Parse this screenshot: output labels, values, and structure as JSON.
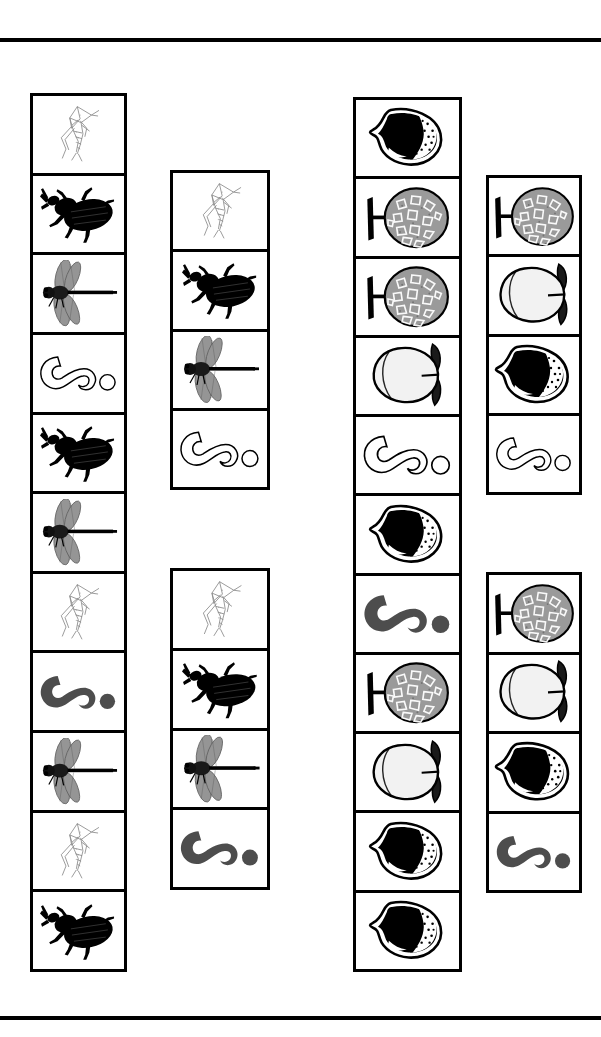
{
  "figure": {
    "background_color": "#ffffff",
    "line_color": "#000000",
    "rules": [
      {
        "name": "top-rule",
        "y": 38
      },
      {
        "name": "bottom-rule",
        "y": 1016
      }
    ],
    "icon_legend": {
      "grasshopper": "grasshopper-icon",
      "beetle": "beetle-icon",
      "dragonfly": "dragonfly-icon",
      "larva_outline": "larva-outline-icon",
      "larva_filled": "larva-filled-icon",
      "fig_dark": "fig-dark-icon",
      "fruit_textured": "fruit-textured-icon",
      "fruit_pale": "fruit-pale-icon"
    },
    "icon_colors": {
      "outline": "#000000",
      "larva_fill": "#4d4d4d",
      "fruit_textured_fill": "#9a9a9a",
      "fruit_pale_fill": "#f2f2f2",
      "fig_fill": "#000000"
    },
    "strips": [
      {
        "id": "strip-1",
        "name": "insect-strip-long-left",
        "group": "insects",
        "x": 30,
        "y": 93,
        "width": 97,
        "height": 879,
        "items": [
          "grasshopper",
          "beetle",
          "dragonfly",
          "larva_outline",
          "beetle",
          "dragonfly",
          "grasshopper",
          "larva_filled",
          "dragonfly",
          "grasshopper",
          "beetle"
        ]
      },
      {
        "id": "strip-2a",
        "name": "insect-strip-upper-right",
        "group": "insects",
        "x": 170,
        "y": 170,
        "width": 100,
        "height": 320,
        "items": [
          "grasshopper",
          "beetle",
          "dragonfly",
          "larva_outline"
        ]
      },
      {
        "id": "strip-2b",
        "name": "insect-strip-lower-right",
        "group": "insects",
        "x": 170,
        "y": 568,
        "width": 100,
        "height": 322,
        "items": [
          "grasshopper",
          "beetle",
          "dragonfly",
          "larva_filled"
        ]
      },
      {
        "id": "strip-3",
        "name": "fruit-strip-long-left",
        "group": "fruits",
        "x": 353,
        "y": 97,
        "width": 109,
        "height": 875,
        "items": [
          "fig_dark",
          "fruit_textured",
          "fruit_textured",
          "fruit_pale",
          "larva_outline",
          "fig_dark",
          "larva_filled",
          "fruit_textured",
          "fruit_pale",
          "fig_dark",
          "fig_dark"
        ]
      },
      {
        "id": "strip-4a",
        "name": "fruit-strip-upper-right",
        "group": "fruits",
        "x": 486,
        "y": 175,
        "width": 96,
        "height": 320,
        "items": [
          "fruit_textured",
          "fruit_pale",
          "fig_dark",
          "larva_outline"
        ]
      },
      {
        "id": "strip-4b",
        "name": "fruit-strip-lower-right",
        "group": "fruits",
        "x": 486,
        "y": 572,
        "width": 96,
        "height": 321,
        "items": [
          "fruit_textured",
          "fruit_pale",
          "fig_dark",
          "larva_filled"
        ]
      }
    ]
  }
}
